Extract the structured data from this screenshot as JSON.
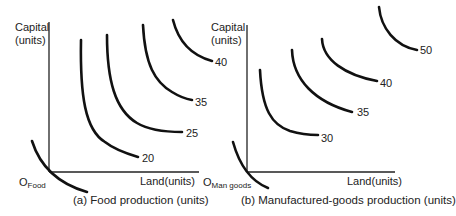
{
  "panels": [
    {
      "id": "a",
      "caption": "(a) Food production (units)",
      "y_axis_label_line1": "Capital",
      "y_axis_label_line2": "(units)",
      "x_axis_label": "Land(units)",
      "origin_main": "O",
      "origin_sub": "Food",
      "isoquants": [
        {
          "label": "20"
        },
        {
          "label": "25"
        },
        {
          "label": "35"
        },
        {
          "label": "40"
        }
      ]
    },
    {
      "id": "b",
      "caption": "(b) Manufactured-goods production (units)",
      "y_axis_label_line1": "Capital",
      "y_axis_label_line2": "(units)",
      "x_axis_label": "Land(units)",
      "origin_main": "O",
      "origin_sub": "Man goods",
      "isoquants": [
        {
          "label": "30"
        },
        {
          "label": "35"
        },
        {
          "label": "40"
        },
        {
          "label": "50"
        }
      ]
    }
  ],
  "colors": {
    "line": "#111111",
    "text": "#222222",
    "background": "#ffffff"
  }
}
